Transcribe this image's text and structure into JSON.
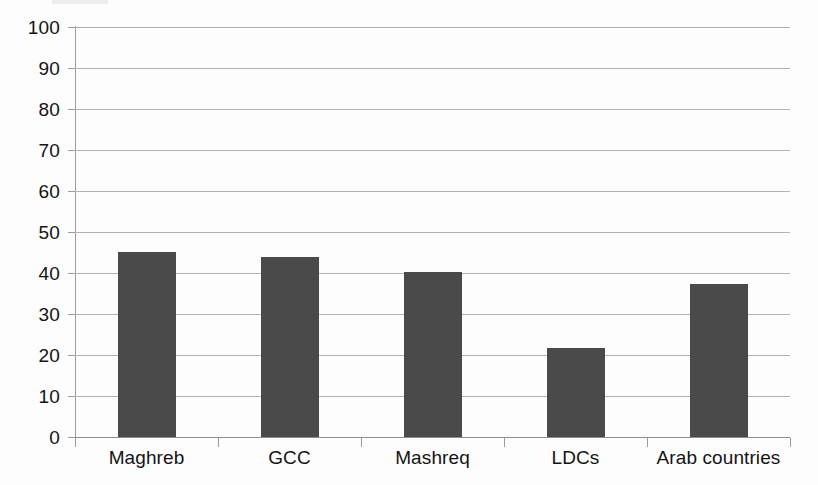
{
  "chart_data": {
    "type": "bar",
    "title": "",
    "subtitle": "",
    "xlabel": "",
    "ylabel": "",
    "categories": [
      "Maghreb",
      "GCC",
      "Mashreq",
      "LDCs",
      "Arab countries"
    ],
    "values": [
      45.2,
      44.0,
      40.3,
      21.8,
      37.3
    ],
    "ylim": [
      0,
      100
    ],
    "ytick_labels": [
      "100",
      "90",
      "80",
      "70",
      "60",
      "50",
      "40",
      "30",
      "20",
      "10",
      "0"
    ],
    "ytick_values": [
      100,
      90,
      80,
      70,
      60,
      50,
      40,
      30,
      20,
      10,
      0
    ],
    "grid": "horizontal",
    "legend": "none",
    "series": [
      {
        "name": "",
        "color": "#4a4a4a",
        "values": [
          45.2,
          44.0,
          40.3,
          21.8,
          37.3
        ]
      }
    ],
    "annotations": []
  },
  "colors": {
    "bar_fill": "#4a4a4a",
    "gridline": "#b4b4b4",
    "axis_line": "#9b9b9b",
    "background": "#fdfdfd",
    "text": "#141414"
  }
}
